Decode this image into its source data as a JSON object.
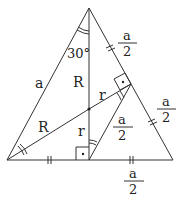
{
  "diagram": {
    "type": "geometry",
    "colors": {
      "line": "#333333",
      "background": "#ffffff"
    },
    "labels": {
      "side_left": "a",
      "angle_top": "30°",
      "circumradius_vertical": "R",
      "circumradius_left": "R",
      "inradius_vertical": "r",
      "inradius_right": "r",
      "half_side_upper_right": {
        "num": "a",
        "den": "2"
      },
      "half_side_lower_right": {
        "num": "a",
        "den": "2"
      },
      "half_side_inner": {
        "num": "a",
        "den": "2"
      },
      "half_side_base": {
        "num": "a",
        "den": "2"
      }
    },
    "markers": [
      "right-angle-base",
      "right-angle-side",
      "equal-ticks-base",
      "equal-ticks-right-side",
      "angle-arcs"
    ]
  }
}
